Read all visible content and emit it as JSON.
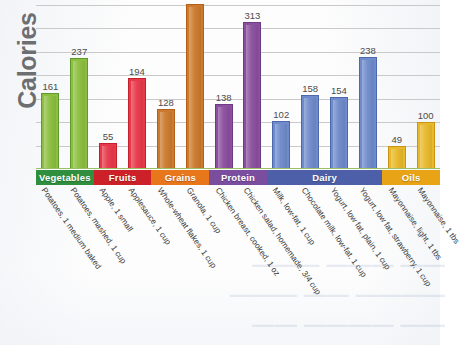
{
  "chart_data": {
    "type": "bar",
    "title": "",
    "xlabel": "",
    "ylabel": "Calories",
    "ylim": [
      0,
      360
    ],
    "grid": true,
    "gridlines": [
      50,
      100,
      150,
      200,
      250,
      300,
      350
    ],
    "legend_position": "below-axis-color-band",
    "categories": [
      "Potatoes, 1 medium baked",
      "Potatoes, mashed, 1 cup",
      "Apple, 1 small",
      "Applesauce, 1 cup",
      "Whole-wheat flakes, 1 cup",
      "Granola, 1 cup",
      "Chicken breast, cooked, 1 oz",
      "Chicken salad, homemade, 3/4 cup",
      "Milk, low-fat, 1 cup",
      "Chocolate milk, low-fat, 1 cup",
      "Yogurt, low fat, plain, 1 cup",
      "Yogurt, low fat, strawberry, 1 cup",
      "Mayonnaise, light, 1 tbs",
      "Mayonnaise, 1 tbs"
    ],
    "values": [
      161,
      237,
      55,
      194,
      128,
      351,
      138,
      313,
      102,
      158,
      154,
      238,
      49,
      100
    ],
    "value_labels": [
      "161",
      "237",
      "55",
      "194",
      "128",
      "",
      "138",
      "313",
      "102",
      "158",
      "154",
      "238",
      "49",
      "100"
    ],
    "groups": [
      {
        "label": "Vegetables",
        "count": 2,
        "color": "#2f8f3e",
        "bar_color": "#8cbf3f",
        "bar_edge": "#5d9a2e"
      },
      {
        "label": "Fruits",
        "count": 2,
        "color": "#cc2128",
        "bar_color": "#e8394a",
        "bar_edge": "#c41f2c"
      },
      {
        "label": "Grains",
        "count": 2,
        "color": "#e8761b",
        "bar_color": "#cc7a2e",
        "bar_edge": "#b4601a"
      },
      {
        "label": "Protein",
        "count": 2,
        "color": "#7b4d9e",
        "bar_color": "#8b4f9e",
        "bar_edge": "#6b3b85"
      },
      {
        "label": "Dairy",
        "count": 4,
        "color": "#4d5fa8",
        "bar_color": "#6f8bcb",
        "bar_edge": "#4d68ad"
      },
      {
        "label": "Oils",
        "count": 2,
        "color": "#e8a317",
        "bar_color": "#e8b92a",
        "bar_edge": "#c99314"
      }
    ]
  },
  "ghost": {
    "line1": "—— ——— ———",
    "line2": "———— —— ———",
    "line3": "—— ———— ——"
  }
}
